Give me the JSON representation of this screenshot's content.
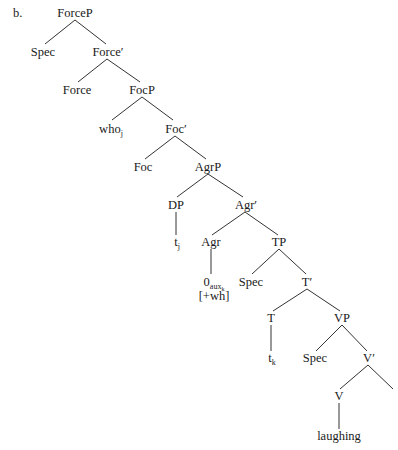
{
  "example_label": "b.",
  "tree": {
    "nodes": {
      "forcep": {
        "label": "ForceP"
      },
      "spec1": {
        "label": "Spec"
      },
      "force_bar": {
        "label": "Force′"
      },
      "force": {
        "label": "Force"
      },
      "focp": {
        "label": "FocP"
      },
      "who": {
        "label": "who",
        "sub": "j"
      },
      "foc_bar": {
        "label": "Foc′"
      },
      "foc": {
        "label": "Foc"
      },
      "agrp": {
        "label": "AgrP"
      },
      "dp": {
        "label": "DP"
      },
      "agr_bar": {
        "label": "Agr′"
      },
      "tj": {
        "label": "t",
        "sub": "j"
      },
      "agr": {
        "label": "Agr"
      },
      "tp": {
        "label": "TP"
      },
      "zero_aux": {
        "label": "0",
        "sub": "aux",
        "subsub": "k",
        "feature": "[+wh]"
      },
      "spec2": {
        "label": "Spec"
      },
      "t_bar": {
        "label": "T′"
      },
      "t": {
        "label": "T"
      },
      "vp": {
        "label": "VP"
      },
      "tk": {
        "label": "t",
        "sub": "k"
      },
      "spec3": {
        "label": "Spec"
      },
      "v_bar": {
        "label": "V′"
      },
      "v": {
        "label": "V"
      },
      "laughing": {
        "label": "laughing"
      }
    }
  }
}
